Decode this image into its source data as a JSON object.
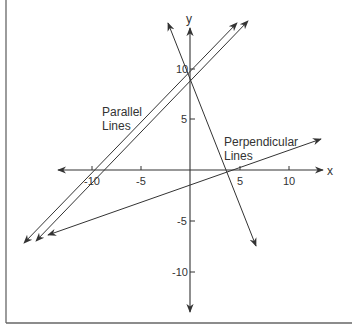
{
  "diagram": {
    "type": "coordinate-plane",
    "x_axis": {
      "label": "x",
      "ticks": [
        {
          "value": -10,
          "label": "-10"
        },
        {
          "value": -5,
          "label": "-5"
        },
        {
          "value": 5,
          "label": "5"
        },
        {
          "value": 10,
          "label": "10"
        }
      ]
    },
    "y_axis": {
      "label": "y",
      "ticks": [
        {
          "value": 10,
          "label": "10"
        },
        {
          "value": 5,
          "label": "5"
        },
        {
          "value": -5,
          "label": "-5"
        },
        {
          "value": -10,
          "label": "-10"
        }
      ]
    },
    "annotations": {
      "parallel": {
        "line1": "Parallel",
        "line2": "Lines"
      },
      "perpendicular": {
        "line1": "Perpendicular",
        "line2": "Lines"
      }
    },
    "lines": [
      {
        "name": "parallel-line-1",
        "from": [
          -17,
          -7
        ],
        "to": [
          5,
          15
        ]
      },
      {
        "name": "parallel-line-2",
        "from": [
          -16,
          -7
        ],
        "to": [
          6,
          15
        ]
      },
      {
        "name": "perpendicular-line-steep",
        "from": [
          -2,
          15
        ],
        "to": [
          7,
          -8
        ]
      },
      {
        "name": "perpendicular-line-shallow",
        "from": [
          -14,
          -6
        ],
        "to": [
          13,
          3
        ]
      }
    ],
    "colors": {
      "stroke": "#333333",
      "frame": "#555555",
      "background": "#ffffff"
    }
  }
}
